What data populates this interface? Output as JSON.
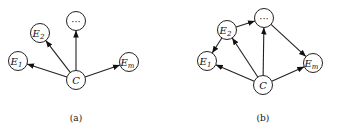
{
  "diagrams": [
    {
      "id": "a",
      "caption": "(a)",
      "caption_pos": [
        76,
        121
      ],
      "nodes": [
        {
          "id": "E1",
          "label": "E",
          "sub": "1",
          "x": 18,
          "y": 61
        },
        {
          "id": "E2",
          "label": "E",
          "sub": "2",
          "x": 40,
          "y": 33
        },
        {
          "id": "dots",
          "label": "···",
          "sub": "",
          "x": 76,
          "y": 21
        },
        {
          "id": "C",
          "label": "C",
          "sub": "",
          "x": 76,
          "y": 80
        },
        {
          "id": "Em",
          "label": "E",
          "sub": "m",
          "x": 129,
          "y": 62
        }
      ],
      "edges": [
        {
          "from": "C",
          "to": "E1"
        },
        {
          "from": "C",
          "to": "E2"
        },
        {
          "from": "C",
          "to": "dots"
        },
        {
          "from": "C",
          "to": "Em"
        }
      ]
    },
    {
      "id": "b",
      "caption": "(b)",
      "caption_pos": [
        263,
        121
      ],
      "nodes": [
        {
          "id": "E1",
          "label": "E",
          "sub": "1",
          "x": 207,
          "y": 61
        },
        {
          "id": "E2",
          "label": "E",
          "sub": "2",
          "x": 227,
          "y": 30
        },
        {
          "id": "dots",
          "label": "···",
          "sub": "",
          "x": 264,
          "y": 18
        },
        {
          "id": "C",
          "label": "C",
          "sub": "",
          "x": 263,
          "y": 85
        },
        {
          "id": "Em",
          "label": "E",
          "sub": "m",
          "x": 313,
          "y": 63
        }
      ],
      "edges": [
        {
          "from": "C",
          "to": "E1"
        },
        {
          "from": "C",
          "to": "E2"
        },
        {
          "from": "C",
          "to": "dots"
        },
        {
          "from": "C",
          "to": "Em"
        },
        {
          "from": "E2",
          "to": "E1"
        },
        {
          "from": "E2",
          "to": "dots"
        },
        {
          "from": "dots",
          "to": "Em"
        }
      ]
    }
  ],
  "node_radius": 9.5,
  "colors": {
    "stroke": "#222222",
    "fill": "#ffffff",
    "text": "#111111"
  }
}
